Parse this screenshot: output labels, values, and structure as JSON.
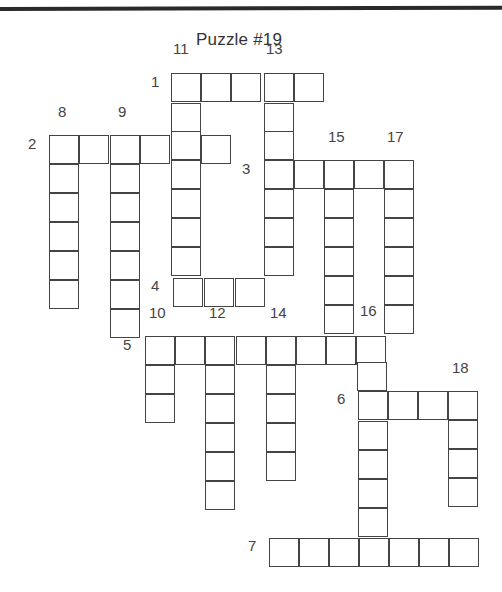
{
  "title": "Puzzle #19",
  "cell_size": {
    "w": 30,
    "h": 29
  },
  "colors": {
    "line": "#444444",
    "rule": "#2a2a2a",
    "text": "#444444"
  },
  "clues": {
    "across": [
      {
        "number": "1",
        "length": 5,
        "cells": [
          [
            171,
            73
          ],
          [
            201,
            73
          ],
          [
            231,
            73
          ],
          [
            264,
            73
          ],
          [
            294,
            73
          ]
        ]
      },
      {
        "number": "2",
        "length": 6,
        "cells": [
          [
            49,
            135
          ],
          [
            79,
            135
          ],
          [
            110,
            135
          ],
          [
            140,
            135
          ],
          [
            171,
            135
          ],
          [
            201,
            135
          ]
        ]
      },
      {
        "number": "3",
        "length": 5,
        "cells": [
          [
            264,
            160
          ],
          [
            294,
            160
          ],
          [
            324,
            160
          ],
          [
            354,
            160
          ],
          [
            384,
            160
          ]
        ]
      },
      {
        "number": "4",
        "length": 3,
        "cells": [
          [
            173,
            278
          ],
          [
            204,
            278
          ],
          [
            235,
            278
          ]
        ]
      },
      {
        "number": "5",
        "length": 8,
        "cells": [
          [
            145,
            336
          ],
          [
            175,
            336
          ],
          [
            205,
            336
          ],
          [
            236,
            336
          ],
          [
            266,
            336
          ],
          [
            296,
            336
          ],
          [
            326,
            336
          ],
          [
            356,
            336
          ]
        ]
      },
      {
        "number": "6",
        "length": 4,
        "cells": [
          [
            358,
            391
          ],
          [
            388,
            391
          ],
          [
            418,
            391
          ],
          [
            448,
            391
          ]
        ]
      },
      {
        "number": "7",
        "length": 7,
        "cells": [
          [
            269,
            538
          ],
          [
            299,
            538
          ],
          [
            329,
            538
          ],
          [
            359,
            538
          ],
          [
            389,
            538
          ],
          [
            419,
            538
          ],
          [
            449,
            538
          ]
        ]
      }
    ],
    "down": [
      {
        "number": "8",
        "length": 6,
        "cells": [
          [
            49,
            135
          ],
          [
            49,
            164
          ],
          [
            49,
            193
          ],
          [
            49,
            222
          ],
          [
            49,
            251
          ],
          [
            49,
            280
          ]
        ]
      },
      {
        "number": "9",
        "length": 7,
        "cells": [
          [
            110,
            135
          ],
          [
            110,
            164
          ],
          [
            110,
            193
          ],
          [
            110,
            222
          ],
          [
            110,
            251
          ],
          [
            110,
            280
          ],
          [
            110,
            309
          ]
        ]
      },
      {
        "number": "10",
        "length": 3,
        "cells": [
          [
            145,
            336
          ],
          [
            145,
            365
          ],
          [
            145,
            394
          ]
        ]
      },
      {
        "number": "11",
        "length": 8,
        "cells": [
          [
            171,
            73
          ],
          [
            171,
            103
          ],
          [
            171,
            131
          ],
          [
            171,
            160
          ],
          [
            171,
            189
          ],
          [
            171,
            218
          ],
          [
            171,
            247
          ],
          [
            173,
            278
          ]
        ]
      },
      {
        "number": "12",
        "length": 6,
        "cells": [
          [
            205,
            336
          ],
          [
            205,
            365
          ],
          [
            205,
            394
          ],
          [
            205,
            423
          ],
          [
            205,
            452
          ],
          [
            205,
            481
          ]
        ]
      },
      {
        "number": "13",
        "length": 7,
        "cells": [
          [
            264,
            73
          ],
          [
            264,
            103
          ],
          [
            264,
            131
          ],
          [
            264,
            160
          ],
          [
            264,
            189
          ],
          [
            264,
            218
          ],
          [
            264,
            247
          ]
        ]
      },
      {
        "number": "14",
        "length": 5,
        "cells": [
          [
            266,
            336
          ],
          [
            266,
            365
          ],
          [
            266,
            394
          ],
          [
            266,
            423
          ],
          [
            266,
            452
          ]
        ]
      },
      {
        "number": "15",
        "length": 7,
        "cells": [
          [
            324,
            160
          ],
          [
            324,
            189
          ],
          [
            324,
            218
          ],
          [
            324,
            247
          ],
          [
            324,
            276
          ],
          [
            324,
            305
          ],
          [
            326,
            336
          ]
        ]
      },
      {
        "number": "16",
        "length": 8,
        "cells": [
          [
            356,
            336
          ],
          [
            357,
            362
          ],
          [
            358,
            391
          ],
          [
            358,
            421
          ],
          [
            358,
            450
          ],
          [
            358,
            479
          ],
          [
            358,
            508
          ],
          [
            359,
            538
          ]
        ]
      },
      {
        "number": "17",
        "length": 6,
        "cells": [
          [
            384,
            160
          ],
          [
            384,
            189
          ],
          [
            384,
            218
          ],
          [
            384,
            247
          ],
          [
            384,
            276
          ],
          [
            384,
            305
          ]
        ]
      },
      {
        "number": "18",
        "length": 4,
        "cells": [
          [
            448,
            391
          ],
          [
            448,
            420
          ],
          [
            448,
            449
          ],
          [
            448,
            478
          ]
        ]
      }
    ]
  },
  "labels": [
    {
      "text": "1",
      "x": 151,
      "y": 83
    },
    {
      "text": "11",
      "x": 173,
      "y": 50
    },
    {
      "text": "13",
      "x": 266,
      "y": 50
    },
    {
      "text": "2",
      "x": 28,
      "y": 145
    },
    {
      "text": "8",
      "x": 58,
      "y": 113
    },
    {
      "text": "9",
      "x": 118,
      "y": 113
    },
    {
      "text": "3",
      "x": 242,
      "y": 170
    },
    {
      "text": "15",
      "x": 328,
      "y": 138
    },
    {
      "text": "17",
      "x": 387,
      "y": 138
    },
    {
      "text": "4",
      "x": 151,
      "y": 287
    },
    {
      "text": "10",
      "x": 149,
      "y": 314
    },
    {
      "text": "12",
      "x": 209,
      "y": 314
    },
    {
      "text": "14",
      "x": 270,
      "y": 314
    },
    {
      "text": "16",
      "x": 360,
      "y": 312
    },
    {
      "text": "5",
      "x": 123,
      "y": 346
    },
    {
      "text": "6",
      "x": 337,
      "y": 400
    },
    {
      "text": "18",
      "x": 452,
      "y": 369
    },
    {
      "text": "7",
      "x": 248,
      "y": 547
    }
  ]
}
